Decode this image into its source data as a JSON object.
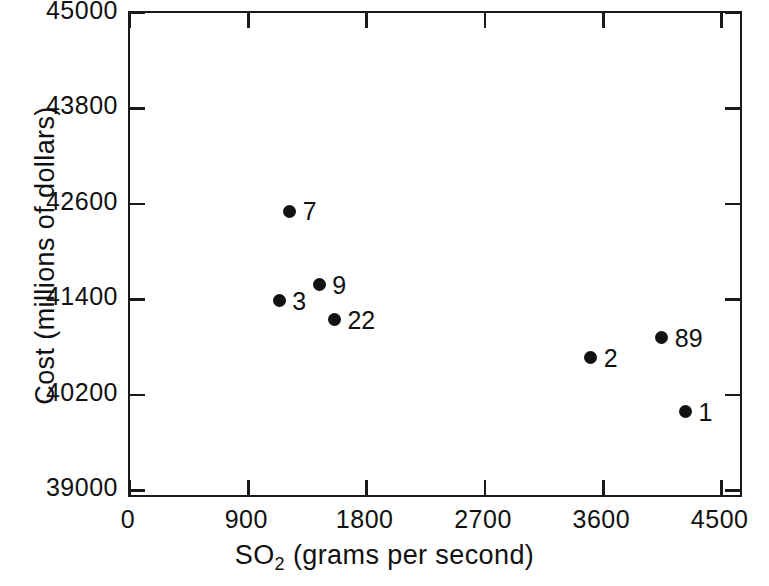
{
  "chart_data": {
    "type": "scatter",
    "title": "",
    "xlabel": "SO2 (grams per second)",
    "xlabel_parts": {
      "pre": "SO",
      "sub": "2",
      "post": " (grams per second)"
    },
    "ylabel": "Cost (millions of dollars)",
    "xlim": [
      0,
      4670
    ],
    "ylim": [
      38890,
      45000
    ],
    "xticks": [
      0,
      900,
      1800,
      2700,
      3600,
      4500
    ],
    "xticklabels": [
      "0",
      "900",
      "1800",
      "2700",
      "3600",
      "4500"
    ],
    "yticks": [
      39000,
      40200,
      41400,
      42600,
      43800,
      45000
    ],
    "yticklabels": [
      "39000",
      "40200",
      "41400",
      "42600",
      "43800",
      "45000"
    ],
    "grid": false,
    "legend": "none",
    "marker": "filled-circle",
    "marker_color": "#121212",
    "points": [
      {
        "label": "7",
        "x": 1230,
        "y": 42480,
        "label_dx": 13,
        "label_dy": -12
      },
      {
        "label": "9",
        "x": 1455,
        "y": 41560,
        "label_dx": 13,
        "label_dy": -12
      },
      {
        "label": "3",
        "x": 1150,
        "y": 41360,
        "label_dx": 13,
        "label_dy": -12
      },
      {
        "label": "22",
        "x": 1570,
        "y": 41120,
        "label_dx": 13,
        "label_dy": -12
      },
      {
        "label": "89",
        "x": 4060,
        "y": 40890,
        "label_dx": 13,
        "label_dy": -12
      },
      {
        "label": "2",
        "x": 3520,
        "y": 40640,
        "label_dx": 13,
        "label_dy": -12
      },
      {
        "label": "1",
        "x": 4240,
        "y": 39960,
        "label_dx": 13,
        "label_dy": -12
      }
    ]
  }
}
